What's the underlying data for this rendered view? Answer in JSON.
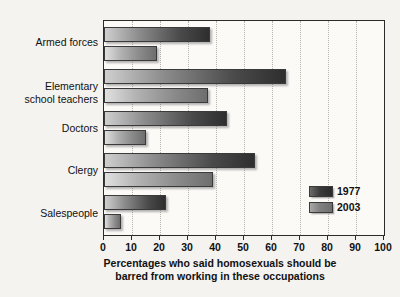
{
  "chart_data": {
    "type": "bar",
    "orientation": "horizontal",
    "title": "",
    "categories": [
      "Armed forces",
      "Elementary\nschool teachers",
      "Doctors",
      "Clergy",
      "Salespeople"
    ],
    "series": [
      {
        "name": "1977",
        "color": "#2e2e2e",
        "values": [
          38,
          65,
          44,
          54,
          22
        ]
      },
      {
        "name": "2003",
        "color": "#6e6e6e",
        "values": [
          19,
          37,
          15,
          39,
          6
        ]
      }
    ],
    "xlabel": "Percentages who said homosexuals should be barred from working in these occupations",
    "ylabel": "",
    "xlim": [
      0,
      100
    ],
    "xticks": [
      0,
      10,
      20,
      30,
      40,
      50,
      60,
      70,
      80,
      90,
      100
    ],
    "xtick_labels": [
      "0",
      "10",
      "20",
      "30",
      "40",
      "50",
      "60",
      "70",
      "80",
      "90",
      "100"
    ],
    "grid": "vertical-dotted",
    "legend_position": "inside-bottom-right"
  },
  "caption": {
    "line1": "Percentages who said homosexuals should be",
    "line2": "barred from working in these occupations"
  },
  "legend": {
    "items": [
      {
        "label": "1977"
      },
      {
        "label": "2003"
      }
    ]
  }
}
